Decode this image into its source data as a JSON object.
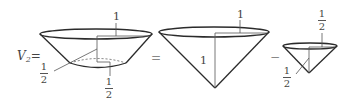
{
  "equation": {
    "lhs_label": "V",
    "lhs_subscript": "2",
    "equals": "=",
    "minus": "−"
  },
  "figures": {
    "frustum": {
      "top_radius_label": "1",
      "bottom_radius_label": {
        "num": "1",
        "den": "2"
      },
      "height_label": {
        "num": "1",
        "den": "2"
      }
    },
    "large_cone": {
      "radius_label": "1",
      "height_label": "1"
    },
    "small_cone": {
      "radius_label": {
        "num": "1",
        "den": "2"
      },
      "height_label": {
        "num": "1",
        "den": "2"
      }
    }
  },
  "colors": {
    "stroke": "#2b2b2b",
    "thin": "#555555",
    "background": "#ffffff"
  }
}
